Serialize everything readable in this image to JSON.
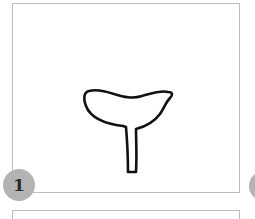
{
  "panels": [
    {
      "number": "1",
      "figure": "mushroom-outline-icon"
    },
    {
      "number": ""
    }
  ],
  "colors": {
    "frame_border": "#bdbdbd",
    "badge_fill": "#b3b3b3",
    "badge_text": "#2a2a2a",
    "stroke": "#111111"
  }
}
